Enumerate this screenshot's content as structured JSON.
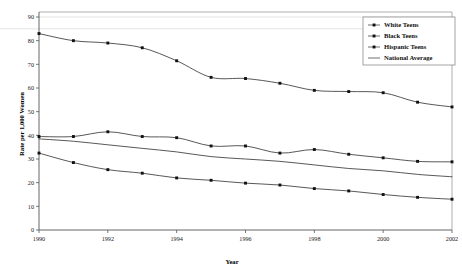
{
  "chart_data": {
    "type": "line",
    "title": "",
    "xlabel": "Year",
    "ylabel": "Rate per 1,000 Women",
    "xlim": [
      1990,
      2002
    ],
    "ylim": [
      0,
      90
    ],
    "ytick_step": 10,
    "xtick_step": 2,
    "grid": "horizontal-faint",
    "legend_position": "top-right",
    "x": [
      1990,
      1991,
      1992,
      1993,
      1994,
      1995,
      1996,
      1997,
      1998,
      1999,
      2000,
      2001,
      2002
    ],
    "xticks": [
      "1990",
      "1992",
      "1994",
      "1996",
      "1998",
      "2000",
      "2002"
    ],
    "yticks": [
      "0",
      "10",
      "20",
      "30",
      "40",
      "50",
      "60",
      "70",
      "80",
      "90"
    ],
    "series": [
      {
        "name": "White Teens",
        "marker": "square",
        "has_markers": true,
        "values": [
          32.5,
          28.5,
          25.5,
          24.0,
          22.0,
          21.0,
          19.8,
          19.0,
          17.5,
          16.5,
          15.0,
          13.8,
          13.0
        ]
      },
      {
        "name": "Black Teens",
        "marker": "square",
        "has_markers": true,
        "values": [
          83.0,
          80.0,
          79.0,
          77.0,
          71.5,
          64.5,
          64.0,
          62.0,
          59.0,
          58.5,
          58.0,
          54.0,
          52.0
        ]
      },
      {
        "name": "Hispanic Teens",
        "marker": "square",
        "has_markers": true,
        "values": [
          39.5,
          39.5,
          41.5,
          39.5,
          39.0,
          35.5,
          35.5,
          32.5,
          34.0,
          32.0,
          30.5,
          29.0,
          28.8
        ]
      },
      {
        "name": "National Average",
        "marker": "none",
        "has_markers": false,
        "values": [
          38.5,
          37.5,
          36.0,
          34.5,
          33.0,
          31.0,
          30.0,
          29.0,
          27.5,
          26.0,
          25.0,
          23.5,
          22.5
        ]
      }
    ],
    "colors": {
      "line": "#3a3a3a",
      "marker": "#111111",
      "axis": "#555555",
      "grid": "#d8d8d8",
      "background": "#ffffff"
    }
  },
  "legend": {
    "items": [
      {
        "label": "White Teens"
      },
      {
        "label": "Black Teens"
      },
      {
        "label": "Hispanic Teens"
      },
      {
        "label": "National Average"
      }
    ]
  },
  "axes": {
    "x_title": "Year",
    "y_title": "Rate per 1,000 Women"
  }
}
